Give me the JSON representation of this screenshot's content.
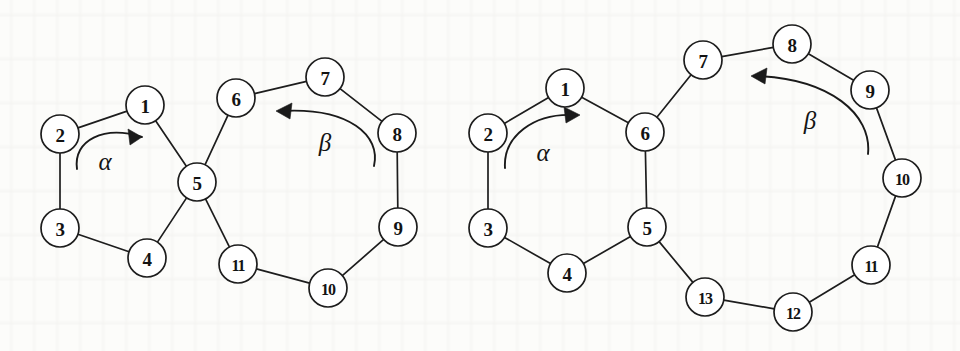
{
  "figure": {
    "background_color": "#fcfcfa",
    "ink_color": "#1d1d1d"
  },
  "diagrams": [
    {
      "id": "left-diagram",
      "nodes": [
        {
          "id": "L1",
          "label": "1",
          "cx": 145,
          "cy": 105,
          "r": 19
        },
        {
          "id": "L2",
          "label": "2",
          "cx": 60,
          "cy": 134,
          "r": 19
        },
        {
          "id": "L3",
          "label": "3",
          "cx": 60,
          "cy": 228,
          "r": 19
        },
        {
          "id": "L4",
          "label": "4",
          "cx": 147,
          "cy": 258,
          "r": 19
        },
        {
          "id": "L5",
          "label": "5",
          "cx": 197,
          "cy": 182,
          "r": 19
        },
        {
          "id": "L6",
          "label": "6",
          "cx": 236,
          "cy": 98,
          "r": 19
        },
        {
          "id": "L7",
          "label": "7",
          "cx": 325,
          "cy": 77,
          "r": 19
        },
        {
          "id": "L8",
          "label": "8",
          "cx": 397,
          "cy": 133,
          "r": 19
        },
        {
          "id": "L9",
          "label": "9",
          "cx": 398,
          "cy": 227,
          "r": 19
        },
        {
          "id": "L10",
          "label": "10",
          "cx": 328,
          "cy": 288,
          "r": 19
        },
        {
          "id": "L11",
          "label": "11",
          "cx": 238,
          "cy": 264,
          "r": 19
        }
      ],
      "edges": [
        [
          "L1",
          "L2"
        ],
        [
          "L2",
          "L3"
        ],
        [
          "L3",
          "L4"
        ],
        [
          "L4",
          "L5"
        ],
        [
          "L5",
          "L1"
        ],
        [
          "L5",
          "L6"
        ],
        [
          "L6",
          "L7"
        ],
        [
          "L7",
          "L8"
        ],
        [
          "L8",
          "L9"
        ],
        [
          "L9",
          "L10"
        ],
        [
          "L10",
          "L11"
        ],
        [
          "L11",
          "L5"
        ]
      ],
      "arrows": [
        {
          "id": "left-alpha",
          "label": "α",
          "label_x": 105,
          "label_y": 161,
          "path": "M 77 169 C 73 140, 104 125, 142 137",
          "head": "142,137 128,129 130,145",
          "direction": "clockwise"
        },
        {
          "id": "left-beta",
          "label": "β",
          "label_x": 325,
          "label_y": 142,
          "path": "M 374 166 C 381 136, 350 107, 281 111",
          "head": "276,111 292,103 290,119",
          "direction": "counterclockwise"
        }
      ]
    },
    {
      "id": "right-diagram",
      "nodes": [
        {
          "id": "R1",
          "label": "1",
          "cx": 565,
          "cy": 88,
          "r": 19
        },
        {
          "id": "R2",
          "label": "2",
          "cx": 488,
          "cy": 133,
          "r": 19
        },
        {
          "id": "R3",
          "label": "3",
          "cx": 488,
          "cy": 228,
          "r": 19
        },
        {
          "id": "R4",
          "label": "4",
          "cx": 567,
          "cy": 273,
          "r": 19
        },
        {
          "id": "R5",
          "label": "5",
          "cx": 647,
          "cy": 227,
          "r": 19
        },
        {
          "id": "R6",
          "label": "6",
          "cx": 645,
          "cy": 132,
          "r": 19
        },
        {
          "id": "R7",
          "label": "7",
          "cx": 703,
          "cy": 60,
          "r": 19
        },
        {
          "id": "R8",
          "label": "8",
          "cx": 792,
          "cy": 44,
          "r": 19
        },
        {
          "id": "R9",
          "label": "9",
          "cx": 870,
          "cy": 90,
          "r": 19
        },
        {
          "id": "R10",
          "label": "10",
          "cx": 902,
          "cy": 178,
          "r": 19
        },
        {
          "id": "R11",
          "label": "11",
          "cx": 871,
          "cy": 265,
          "r": 19
        },
        {
          "id": "R12",
          "label": "12",
          "cx": 793,
          "cy": 312,
          "r": 19
        },
        {
          "id": "R13",
          "label": "13",
          "cx": 705,
          "cy": 297,
          "r": 19
        }
      ],
      "edges": [
        [
          "R1",
          "R2"
        ],
        [
          "R2",
          "R3"
        ],
        [
          "R3",
          "R4"
        ],
        [
          "R4",
          "R5"
        ],
        [
          "R5",
          "R6"
        ],
        [
          "R6",
          "R1"
        ],
        [
          "R6",
          "R7"
        ],
        [
          "R7",
          "R8"
        ],
        [
          "R8",
          "R9"
        ],
        [
          "R9",
          "R10"
        ],
        [
          "R10",
          "R11"
        ],
        [
          "R11",
          "R12"
        ],
        [
          "R12",
          "R13"
        ],
        [
          "R13",
          "R5"
        ]
      ],
      "arrows": [
        {
          "id": "right-alpha",
          "label": "α",
          "label_x": 543,
          "label_y": 152,
          "path": "M 505 168 C 503 136, 534 113, 574 115",
          "head": "580,115, 564,107, 566,123",
          "direction": "clockwise"
        },
        {
          "id": "right-beta",
          "label": "β",
          "label_x": 810,
          "label_y": 120,
          "path": "M 868 154 C 872 114, 830 79, 757 76",
          "head": "751,76 767,68 765,84",
          "direction": "counterclockwise"
        }
      ]
    }
  ]
}
